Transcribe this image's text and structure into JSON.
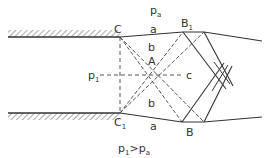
{
  "diagram": {
    "labels": {
      "pa_top": "pa",
      "C": "C",
      "C1": "C1",
      "B": "B",
      "B1": "B1",
      "A": "A",
      "a_top": "a",
      "a_bottom": "a",
      "b_top": "b",
      "b_bottom": "b",
      "c": "c",
      "p1": "p1",
      "condition": "p1>pa"
    },
    "colors": {
      "line": "#3a3a3a",
      "background": "#ffffff"
    }
  }
}
